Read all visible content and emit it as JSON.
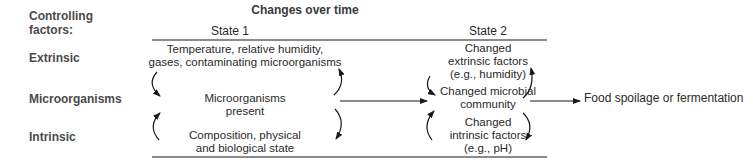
{
  "header": {
    "controlling_factors": "Controlling factors:",
    "changes_over_time": "Changes over time",
    "state1": "State 1",
    "state2": "State 2"
  },
  "rows": {
    "extrinsic": "Extrinsic",
    "microorganisms": "Microorganisms",
    "intrinsic": "Intrinsic"
  },
  "state1": {
    "extrinsic": [
      "Temperature, relative humidity,",
      "gases, contaminating microorganisms"
    ],
    "microorganisms": [
      "Microorganisms",
      "present"
    ],
    "intrinsic": [
      "Composition, physical",
      "and biological state"
    ]
  },
  "state2": {
    "extrinsic": [
      "Changed",
      "extrinsic factors",
      "(e.g., humidity)"
    ],
    "microorganisms": [
      "Changed microbial",
      "community"
    ],
    "intrinsic": [
      "Changed",
      "intrinsic factors",
      "(e.g., pH)"
    ]
  },
  "outcome": "Food spoilage or fermentation",
  "colors": {
    "text": "#2a2a2a",
    "label": "#4a4a4a",
    "rule": "#8a8a8a",
    "arrow": "#1a1a1a"
  }
}
